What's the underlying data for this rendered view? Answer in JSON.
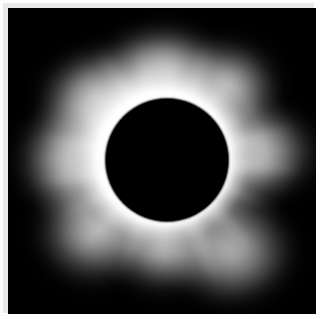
{
  "image": {
    "subject": "total-solar-eclipse-corona",
    "caption_visible": false,
    "alt_text": "Total solar eclipse showing the white solar corona surrounding the black silhouette of the moon",
    "background_color": "#ffffff",
    "photo_background_color": "#000000",
    "corona_color": "#ffffff",
    "moon_color": "#000000",
    "frame_color": "#e9e9e9"
  },
  "photo": {
    "canvas": {
      "left": 5,
      "top": 5,
      "width": 308,
      "height": 306
    },
    "moon_disk": {
      "center_x": 164,
      "center_y": 157,
      "radius": 61
    },
    "corona": {
      "inner_radius": 61,
      "outer_radius": 128,
      "brightest_radius": 74
    },
    "streamer_lobes": [
      {
        "name": "upper-left",
        "left": 28,
        "top": 40,
        "width": 118,
        "height": 104
      },
      {
        "name": "top",
        "left": 96,
        "top": 18,
        "width": 118,
        "height": 86
      },
      {
        "name": "top-right",
        "left": 168,
        "top": 32,
        "width": 104,
        "height": 92
      },
      {
        "name": "left",
        "left": 6,
        "top": 94,
        "width": 110,
        "height": 116
      },
      {
        "name": "right",
        "left": 192,
        "top": 96,
        "width": 120,
        "height": 96
      },
      {
        "name": "lower-left",
        "left": 26,
        "top": 172,
        "width": 116,
        "height": 106
      },
      {
        "name": "bottom",
        "left": 104,
        "top": 196,
        "width": 104,
        "height": 88
      },
      {
        "name": "lower-right",
        "left": 160,
        "top": 190,
        "width": 130,
        "height": 110
      }
    ],
    "rays": [
      {
        "angle": -122,
        "length": 92,
        "opacity": 0.75,
        "thickness": 12
      },
      {
        "angle": -104,
        "length": 80,
        "opacity": 0.6,
        "thickness": 10
      },
      {
        "angle": -88,
        "length": 74,
        "opacity": 0.55,
        "thickness": 11
      },
      {
        "angle": -70,
        "length": 86,
        "opacity": 0.68,
        "thickness": 13
      },
      {
        "angle": -52,
        "length": 78,
        "opacity": 0.58,
        "thickness": 11
      },
      {
        "angle": -32,
        "length": 70,
        "opacity": 0.5,
        "thickness": 10
      },
      {
        "angle": -14,
        "length": 88,
        "opacity": 0.7,
        "thickness": 14
      },
      {
        "angle": 4,
        "length": 96,
        "opacity": 0.74,
        "thickness": 13
      },
      {
        "angle": 24,
        "length": 78,
        "opacity": 0.56,
        "thickness": 11
      },
      {
        "angle": 46,
        "length": 88,
        "opacity": 0.66,
        "thickness": 13
      },
      {
        "angle": 68,
        "length": 96,
        "opacity": 0.72,
        "thickness": 14
      },
      {
        "angle": 92,
        "length": 72,
        "opacity": 0.48,
        "thickness": 10
      },
      {
        "angle": 112,
        "length": 82,
        "opacity": 0.62,
        "thickness": 12
      },
      {
        "angle": 134,
        "length": 90,
        "opacity": 0.7,
        "thickness": 13
      },
      {
        "angle": 152,
        "length": 84,
        "opacity": 0.64,
        "thickness": 12
      },
      {
        "angle": 170,
        "length": 96,
        "opacity": 0.76,
        "thickness": 14
      },
      {
        "angle": -170,
        "length": 90,
        "opacity": 0.7,
        "thickness": 13
      },
      {
        "angle": -150,
        "length": 80,
        "opacity": 0.58,
        "thickness": 11
      }
    ]
  }
}
